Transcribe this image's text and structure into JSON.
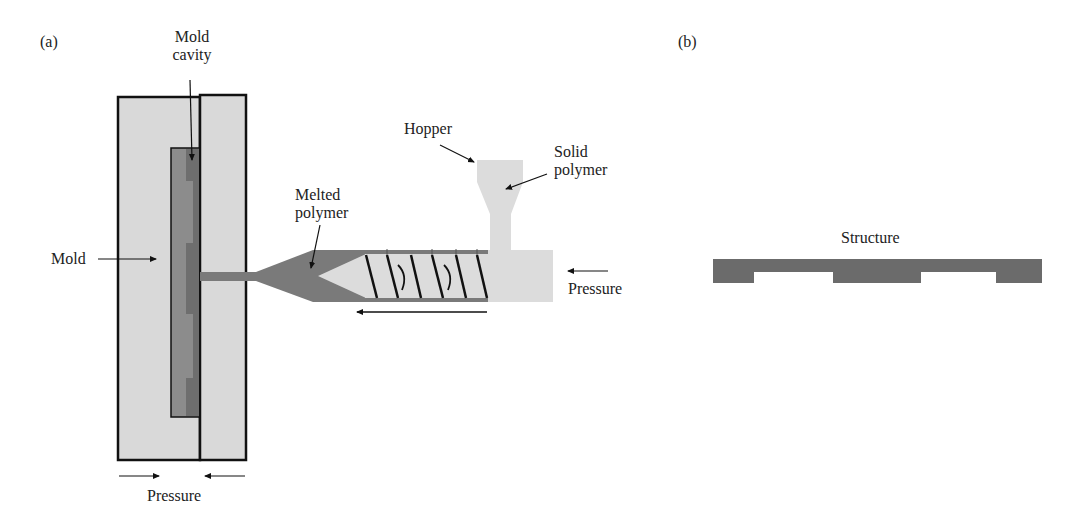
{
  "panel_a": {
    "tag": "(a)",
    "labels": {
      "mold_cavity_line1": "Mold",
      "mold_cavity_line2": "cavity",
      "mold": "Mold",
      "melted_line1": "Melted",
      "melted_line2": "polymer",
      "hopper": "Hopper",
      "solid_line1": "Solid",
      "solid_line2": "polymer",
      "pressure_right": "Pressure",
      "pressure_bottom": "Pressure"
    }
  },
  "panel_b": {
    "tag": "(b)",
    "labels": {
      "structure": "Structure"
    }
  },
  "colors": {
    "mold_fill": "#d9d9d9",
    "cavity_fill": "#8a8a8a",
    "cavity_dark": "#6e6e6e",
    "melt_fill": "#7a7a7a",
    "barrel_light": "#dcdcdc",
    "structure_fill": "#6b6b6b",
    "outline": "#111111"
  }
}
